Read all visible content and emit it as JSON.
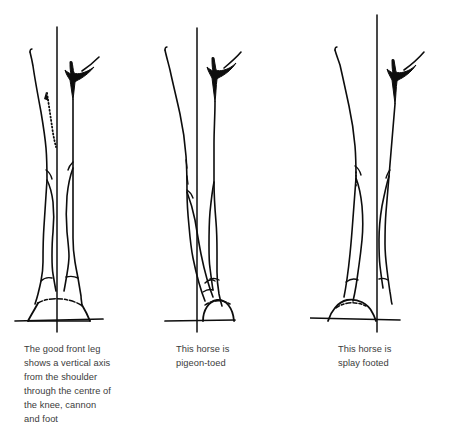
{
  "figure": {
    "background_color": "#ffffff",
    "line_color": "#0d0d0d",
    "text_color": "#3b3b3b",
    "width": 452,
    "height": 426
  },
  "panels": [
    {
      "id": "good-front-leg",
      "label": "Correct front leg conformation",
      "caption": "The good front leg\nshows a vertical axis\nfrom the shoulder\nthrough the centre of\nthe knee, cannon\nand foot",
      "axis_name": "vertical-plumb-line",
      "has_dotted_guide": true,
      "ground_line_name": "ground-line"
    },
    {
      "id": "pigeon-toed",
      "label": "Pigeon-toed front leg conformation",
      "caption": "This horse is\npigeon-toed",
      "axis_name": "vertical-plumb-line",
      "has_dotted_guide": false,
      "ground_line_name": "ground-line"
    },
    {
      "id": "splay-footed",
      "label": "Splay footed front leg conformation",
      "caption": "This horse is\nsplay footed",
      "axis_name": "vertical-plumb-line",
      "has_dotted_guide": true,
      "ground_line_name": "ground-line"
    }
  ]
}
